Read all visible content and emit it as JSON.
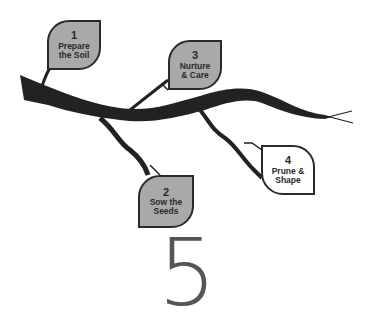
{
  "colors": {
    "leaf_filled": "#a9a9a9",
    "leaf_empty": "#ffffff",
    "branch": "#222222",
    "big_number": "#555555"
  },
  "steps": [
    {
      "number": "1",
      "line1": "Prepare",
      "line2": "the Soil",
      "filled": true
    },
    {
      "number": "2",
      "line1": "Sow the",
      "line2": "Seeds",
      "filled": true
    },
    {
      "number": "3",
      "line1": "Nurture",
      "line2": "& Care",
      "filled": true
    },
    {
      "number": "4",
      "line1": "Prune &",
      "line2": "Shape",
      "filled": false
    }
  ],
  "big_number": "5"
}
